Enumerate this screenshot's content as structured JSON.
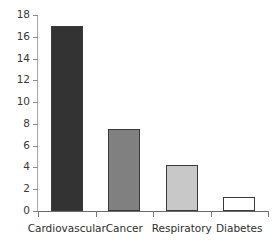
{
  "chart_data": {
    "type": "bar",
    "title": "",
    "subtitle": "",
    "xlabel": "",
    "ylabel": "",
    "categories": [
      "Cardiovascular",
      "Cancer",
      "Respiratory",
      "Diabetes"
    ],
    "values": [
      17,
      7.5,
      4.2,
      1.3
    ],
    "bar_colors": [
      "#333333",
      "#808080",
      "#c8c8c8",
      "#ffffff"
    ],
    "bar_edge_color": "#3a3a3a",
    "ylim": [
      0,
      18
    ],
    "ytick_labels": [
      "0",
      "2",
      "4",
      "6",
      "8",
      "10",
      "12",
      "14",
      "16",
      "18"
    ],
    "ytick_values": [
      0,
      2,
      4,
      6,
      8,
      10,
      12,
      14,
      16,
      18
    ],
    "grid": false,
    "legend": null,
    "legend_position": "none",
    "axis_color": "#6b6b6b",
    "tick_color": "#8d8d8d",
    "text_color": "#2e2e2e",
    "background_color": "#ffffff"
  }
}
